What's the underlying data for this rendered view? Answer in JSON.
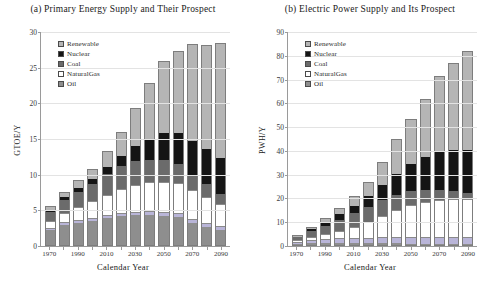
{
  "figure": {
    "x_axis_label": "Calendar Year",
    "categories": [
      "1970",
      "1980",
      "1990",
      "2000",
      "2010",
      "2020",
      "2030",
      "2040",
      "2050",
      "2060",
      "2070",
      "2080",
      "2090"
    ],
    "tick_labels": [
      "1970",
      "",
      "1990",
      "",
      "2010",
      "",
      "2030",
      "",
      "2050",
      "",
      "2070",
      "",
      "2090"
    ],
    "legend_entries": [
      "Renewable",
      "Nuclear",
      "Coal",
      "NaturalGas",
      "Oil"
    ],
    "colors": {
      "renewable": "#b5b5b5",
      "nuclear": "#151515",
      "coal": "#6b6b6b",
      "naturalgas": "#ffffff",
      "oil": "#8e8e8e",
      "hydro": "#b9b5d8"
    }
  },
  "chart_data": [
    {
      "type": "bar",
      "id": "primary-energy-supply",
      "title": "(a) Primary Energy Supply and Their Prospect",
      "xlabel": "Calendar Year",
      "ylabel": "GTOE/Y",
      "ylim": [
        0,
        30
      ],
      "yticks": [
        0,
        5,
        10,
        15,
        20,
        25,
        30
      ],
      "grid": true,
      "legend_position": "top-left",
      "stacked": true,
      "stack_order_bottom_to_top": [
        "Oil",
        "Hydro",
        "NaturalGas",
        "Coal",
        "Nuclear",
        "Renewable"
      ],
      "categories": [
        "1970",
        "1980",
        "1990",
        "2000",
        "2010",
        "2020",
        "2030",
        "2040",
        "2050",
        "2060",
        "2070",
        "2080",
        "2090"
      ],
      "series": [
        {
          "name": "Oil",
          "values": [
            2.3,
            3.1,
            3.3,
            3.6,
            4.0,
            4.2,
            4.3,
            4.3,
            4.2,
            4.0,
            3.2,
            2.6,
            2.2
          ]
        },
        {
          "name": "Hydro",
          "values": [
            0.2,
            0.2,
            0.3,
            0.3,
            0.3,
            0.3,
            0.3,
            0.4,
            0.4,
            0.4,
            0.4,
            0.4,
            0.4
          ]
        },
        {
          "name": "NaturalGas",
          "values": [
            0.9,
            1.3,
            1.8,
            2.3,
            2.8,
            3.4,
            3.8,
            4.0,
            4.2,
            4.2,
            4.0,
            3.6,
            3.0
          ]
        },
        {
          "name": "Coal",
          "values": [
            1.5,
            1.9,
            2.2,
            2.5,
            3.0,
            3.3,
            3.4,
            3.3,
            3.1,
            2.7,
            2.2,
            1.8,
            1.4
          ]
        },
        {
          "name": "Nuclear",
          "values": [
            0.1,
            0.4,
            0.6,
            0.7,
            1.0,
            1.5,
            2.2,
            3.0,
            3.8,
            4.4,
            4.8,
            5.0,
            5.1
          ]
        },
        {
          "name": "Renewable",
          "values": [
            0.6,
            0.7,
            1.0,
            1.4,
            2.2,
            3.3,
            5.3,
            7.9,
            10.3,
            11.6,
            13.7,
            14.8,
            16.3
          ]
        }
      ],
      "totals": [
        5.6,
        7.6,
        9.2,
        10.8,
        13.3,
        16.0,
        19.3,
        22.9,
        26.0,
        27.3,
        28.3,
        28.2,
        28.4
      ]
    },
    {
      "type": "bar",
      "id": "electric-power-supply",
      "title": "(b) Electric Power Supply and Its Prospect",
      "xlabel": "Calendar Year",
      "ylabel": "PWH/Y",
      "ylim": [
        0,
        90
      ],
      "yticks": [
        0,
        10,
        20,
        30,
        40,
        50,
        60,
        70,
        80,
        90
      ],
      "grid": true,
      "legend_position": "top-left",
      "stacked": true,
      "stack_order_bottom_to_top": [
        "Oil",
        "Hydro",
        "NaturalGas",
        "Coal",
        "Nuclear",
        "Renewable"
      ],
      "categories": [
        "1970",
        "1980",
        "1990",
        "2000",
        "2010",
        "2020",
        "2030",
        "2040",
        "2050",
        "2060",
        "2070",
        "2080",
        "2090"
      ],
      "series": [
        {
          "name": "Oil",
          "values": [
            1.0,
            1.3,
            1.2,
            1.1,
            1.0,
            0.9,
            0.8,
            0.7,
            0.6,
            0.5,
            0.4,
            0.3,
            0.3
          ]
        },
        {
          "name": "Hydro",
          "values": [
            0.6,
            0.9,
            1.2,
            1.5,
            1.8,
            2.0,
            2.2,
            2.4,
            2.5,
            2.6,
            2.7,
            2.8,
            2.8
          ]
        },
        {
          "name": "NaturalGas",
          "values": [
            0.5,
            1.0,
            1.8,
            3.0,
            4.6,
            6.6,
            9.0,
            11.4,
            13.4,
            14.6,
            15.4,
            15.8,
            15.6
          ]
        },
        {
          "name": "Coal",
          "values": [
            1.8,
            3.0,
            4.2,
            5.4,
            6.3,
            6.8,
            6.9,
            6.6,
            6.0,
            5.2,
            4.3,
            3.4,
            2.6
          ]
        },
        {
          "name": "Nuclear",
          "values": [
            0.2,
            1.2,
            2.0,
            2.6,
            3.4,
            4.8,
            6.8,
            9.2,
            11.8,
            14.4,
            16.4,
            17.8,
            18.8
          ]
        },
        {
          "name": "Renewable",
          "values": [
            0.4,
            0.8,
            1.4,
            2.3,
            3.8,
            6.0,
            9.7,
            14.6,
            19.0,
            24.4,
            32.1,
            36.9,
            42.1
          ]
        }
      ],
      "totals": [
        4.5,
        8.2,
        11.8,
        15.9,
        20.9,
        27.1,
        35.4,
        44.9,
        53.3,
        61.7,
        71.3,
        77.0,
        82.2
      ]
    }
  ]
}
